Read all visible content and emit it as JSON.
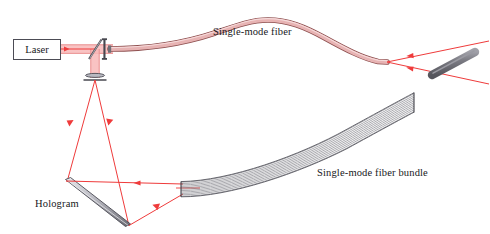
{
  "figure": {
    "width": 490,
    "height": 234,
    "background": "#ffffff"
  },
  "colors": {
    "beam": "#ef3b3b",
    "beam_wide": "#f7a9a9",
    "fiber_core": "#e3a6a6",
    "fiber_edge": "#9e5a5a",
    "optic_gray": "#5a5a62",
    "bundle_line": "#6e6e76",
    "sample_gray": "#77777e",
    "text": "#17171b",
    "box_border": "#4c4c55"
  },
  "labels": {
    "laser": "Laser",
    "single_mode_fiber": "Single-mode fiber",
    "fiber_bundle": "Single-mode fiber bundle",
    "hologram": "Hologram"
  },
  "components": [
    {
      "name": "laser-source",
      "label": "Laser",
      "x": 13,
      "y": 39,
      "w": 48,
      "h": 21
    },
    {
      "name": "beam-splitter",
      "label": "",
      "x1": 89,
      "y1": 58,
      "x2": 101,
      "y2": 40
    },
    {
      "name": "coupling-lens-vertical",
      "label": "",
      "x": 104,
      "y": 39,
      "w": 2,
      "h": 19
    },
    {
      "name": "focusing-lens-horizontal",
      "label": "",
      "x": 87,
      "y": 76,
      "w": 20,
      "h": 3
    },
    {
      "name": "hologram-plate",
      "label": "Hologram",
      "x1": 67,
      "y1": 181,
      "x2": 128,
      "y2": 226
    },
    {
      "name": "single-mode-fiber",
      "label": "Single-mode fiber"
    },
    {
      "name": "fiber-bundle",
      "label": "Single-mode fiber bundle"
    },
    {
      "name": "sample-cylinder",
      "label": ""
    }
  ],
  "beam_paths": [
    {
      "name": "laser-to-splitter",
      "from": [
        61,
        49
      ],
      "to": [
        95,
        49
      ],
      "arrow": true
    },
    {
      "name": "splitter-to-fiber",
      "from": [
        95,
        49
      ],
      "to": [
        112,
        49
      ],
      "arrow": false
    },
    {
      "name": "splitter-down",
      "from": [
        95,
        49
      ],
      "to": [
        95,
        77
      ],
      "arrow": false
    },
    {
      "name": "lens-diverge-left",
      "from": [
        95,
        79
      ],
      "to": [
        67,
        182
      ],
      "arrow": true
    },
    {
      "name": "lens-diverge-right",
      "from": [
        95,
        79
      ],
      "to": [
        128,
        225
      ],
      "arrow": true
    },
    {
      "name": "hologram-to-bundle-upper",
      "from": [
        67,
        182
      ],
      "to": [
        182,
        184
      ],
      "arrow": true
    },
    {
      "name": "hologram-to-bundle-lower",
      "from": [
        128,
        225
      ],
      "to": [
        182,
        194
      ],
      "arrow": true
    },
    {
      "name": "fiber-tip-to-sample-upper",
      "from": [
        386,
        62
      ],
      "to": [
        486,
        43
      ],
      "arrow": true
    },
    {
      "name": "fiber-tip-to-sample-lower",
      "from": [
        386,
        62
      ],
      "to": [
        486,
        83
      ],
      "arrow": true
    }
  ]
}
